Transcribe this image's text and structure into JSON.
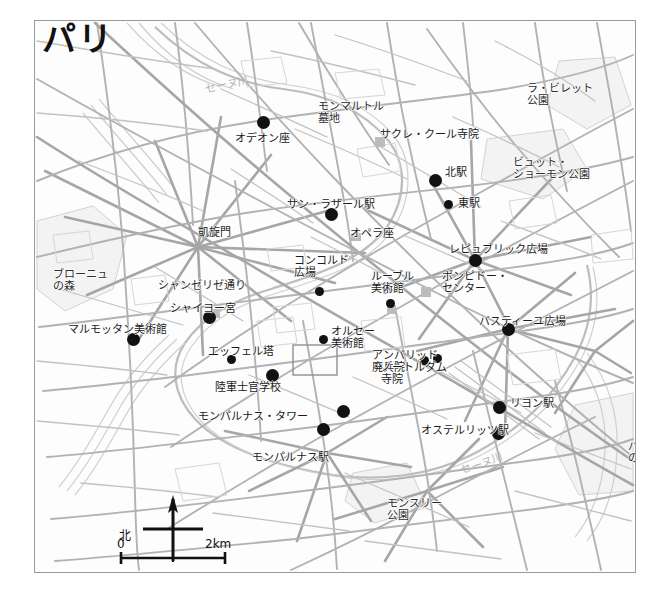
{
  "map": {
    "title": "パリ",
    "frame": {
      "x": 34,
      "y": 20,
      "w": 600,
      "h": 551
    },
    "scale_bar": {
      "zero_label": "0",
      "max_label": "2km",
      "north_label": "北"
    },
    "river_labels": [
      {
        "text": "セーヌ川",
        "x": 170,
        "y": 58,
        "rotate": -12
      },
      {
        "text": "セーヌ川",
        "x": 425,
        "y": 437,
        "rotate": -20
      }
    ],
    "area_labels": [
      {
        "name": "bois-de-boulogne",
        "text": "ブローニュ\nの森",
        "x": 18,
        "y": 248
      },
      {
        "name": "parc-de-la-villette",
        "text": "ラ・ビレット\n公園",
        "x": 492,
        "y": 62
      },
      {
        "name": "parc-buttes-chaumont",
        "text": "ビュット・\nショーモン公園",
        "x": 478,
        "y": 136
      },
      {
        "name": "bois-de-vincennes",
        "text": "バンセンヌ\nの森",
        "x": 593,
        "y": 420
      },
      {
        "name": "parc-montsouris",
        "text": "モンスリー\n公園",
        "x": 352,
        "y": 477
      },
      {
        "name": "montmartre-cemetery",
        "text": "モンマルトル\n墓地",
        "x": 283,
        "y": 80
      },
      {
        "name": "champs-elysees",
        "text": "シャンゼリゼ通り",
        "x": 123,
        "y": 259
      }
    ],
    "pois": [
      {
        "name": "odeon",
        "text": "オデオン座",
        "dot": [
          228,
          101
        ],
        "label": [
          200,
          112
        ],
        "size": "big"
      },
      {
        "name": "sacre-coeur",
        "text": "サクレ・クール寺院",
        "dot": null,
        "label": [
          345,
          108
        ],
        "size": "none"
      },
      {
        "name": "gare-du-nord",
        "text": "北駅",
        "dot": [
          400,
          159
        ],
        "label": [
          410,
          146
        ],
        "size": "big"
      },
      {
        "name": "gare-de-l-est",
        "text": "東駅",
        "dot": [
          413,
          183
        ],
        "label": [
          423,
          177
        ],
        "size": "small"
      },
      {
        "name": "gare-saint-lazare",
        "text": "サン・ラザール駅",
        "dot": [
          296,
          193
        ],
        "label": [
          252,
          178
        ],
        "size": "big"
      },
      {
        "name": "arc-de-triomphe",
        "text": "凱旋門",
        "dot": null,
        "label": [
          163,
          206
        ],
        "size": "none"
      },
      {
        "name": "opera",
        "text": "オペラ座",
        "dot": null,
        "label": [
          315,
          207
        ],
        "size": "none"
      },
      {
        "name": "place-republique",
        "text": "レピュブリック広場",
        "dot": [
          440,
          239
        ],
        "label": [
          414,
          223
        ],
        "size": "big"
      },
      {
        "name": "place-concorde",
        "text": "コンコルド\n広場",
        "dot": [
          284,
          270
        ],
        "label": [
          259,
          234
        ],
        "size": "small"
      },
      {
        "name": "louvre",
        "text": "ルーブル\n美術館",
        "dot": [
          355,
          282
        ],
        "label": [
          336,
          250
        ],
        "size": "small"
      },
      {
        "name": "centre-pompidou",
        "text": "ポンピドー・\nセンター",
        "dot": null,
        "label": [
          407,
          250
        ],
        "size": "none"
      },
      {
        "name": "palais-chaillot",
        "text": "シャイヨー宮",
        "dot": [
          174,
          296
        ],
        "label": [
          135,
          282
        ],
        "size": "big"
      },
      {
        "name": "place-bastille",
        "text": "バスティーユ広場",
        "dot": [
          473,
          308
        ],
        "label": [
          444,
          295
        ],
        "size": "big"
      },
      {
        "name": "musee-marmottan",
        "text": "マルモッタン美術館",
        "dot": [
          98,
          318
        ],
        "label": [
          33,
          303
        ],
        "size": "big"
      },
      {
        "name": "musee-d-orsay",
        "text": "オルセー\n美術館",
        "dot": [
          288,
          318
        ],
        "label": [
          296,
          305
        ],
        "size": "small"
      },
      {
        "name": "eiffel-tower",
        "text": "エッフェル塔",
        "dot": [
          196,
          338
        ],
        "label": [
          173,
          325
        ],
        "size": "small"
      },
      {
        "name": "invalides",
        "text": "アンバリッド\n廃兵院",
        "dot": [
          389,
          339
        ],
        "label": [
          337,
          329
        ],
        "size": "small"
      },
      {
        "name": "notre-dame",
        "text": "ノートルダム\n寺院",
        "dot": [
          402,
          337
        ],
        "label": [
          346,
          341
        ],
        "size": "small"
      },
      {
        "name": "ecole-militaire",
        "text": "陸軍士官学校",
        "dot": [
          237,
          354
        ],
        "label": [
          180,
          361
        ],
        "size": "big"
      },
      {
        "name": "gare-de-lyon",
        "text": "リヨン駅",
        "dot": [
          464,
          386
        ],
        "label": [
          475,
          377
        ],
        "size": "big"
      },
      {
        "name": "tour-montparnasse",
        "text": "モンパルナス・タワー",
        "dot": [
          308,
          390
        ],
        "label": [
          163,
          390
        ],
        "size": "big"
      },
      {
        "name": "gare-austerlitz",
        "text": "オステルリッツ駅",
        "dot": [
          463,
          412
        ],
        "label": [
          386,
          404
        ],
        "size": "big"
      },
      {
        "name": "gare-montparnasse",
        "text": "モンパルナス駅",
        "dot": [
          288,
          408
        ],
        "label": [
          217,
          431
        ],
        "size": "big"
      }
    ]
  }
}
